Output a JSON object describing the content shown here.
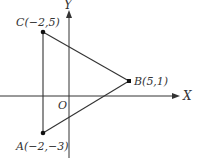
{
  "diagram": {
    "type": "coordinate-plane-triangle",
    "axes": {
      "x_label": "X",
      "y_label": "Y",
      "origin_label": "O"
    },
    "points": [
      {
        "name": "A",
        "label": "A(−2,−3)",
        "x": -2,
        "y": -3
      },
      {
        "name": "B",
        "label": "B(5,1)",
        "x": 5,
        "y": 1
      },
      {
        "name": "C",
        "label": "C(−2,5)",
        "x": -2,
        "y": 5
      }
    ],
    "edges": [
      [
        "A",
        "B"
      ],
      [
        "B",
        "C"
      ],
      [
        "C",
        "A"
      ]
    ],
    "colors": {
      "line": "#333333",
      "point": "#111111",
      "background": "#ffffff"
    }
  }
}
